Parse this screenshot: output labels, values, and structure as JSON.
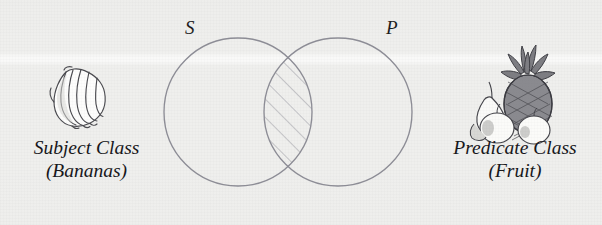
{
  "figure": {
    "type": "venn-diagram",
    "background_color": "#f2f2f0",
    "stroke_color": "#8e8e96",
    "text_color": "#16161a"
  },
  "diagram": {
    "left_circle": {
      "letter": "S",
      "cx": 238,
      "cy": 112,
      "r": 74
    },
    "right_circle": {
      "letter": "P",
      "cx": 338,
      "cy": 112,
      "r": 74
    },
    "intersection": {
      "shading": "diagonal-hatch",
      "hatch_angle_deg": 45,
      "hatch_spacing_px": 13,
      "meaning": "shaded-overlap"
    }
  },
  "labels": {
    "subject": {
      "line1": "Subject Class",
      "line2": "(Bananas)"
    },
    "predicate": {
      "line1": "Predicate Class",
      "line2": "(Fruit)"
    }
  },
  "illustrations": {
    "left": {
      "name": "bananas-illustration",
      "subject": "bunch of bananas"
    },
    "right": {
      "name": "fruit-illustration",
      "subject": "pineapple with pear and apples"
    }
  }
}
